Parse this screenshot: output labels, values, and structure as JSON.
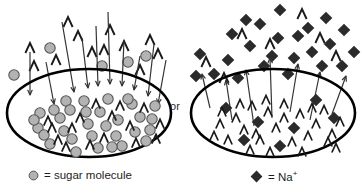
{
  "diagram": {
    "connector_label": "or",
    "colors": {
      "sugar_fill": "#b3b3b3",
      "sugar_stroke": "#555555",
      "sodium_fill": "#2b2b2b",
      "membrane_stroke": "#000000",
      "water_stroke": "#1a1a1a",
      "arrow_stroke": "#333333",
      "background": "#ffffff",
      "text": "#1d1d1d"
    }
  },
  "legend": {
    "sugar": {
      "symbol_name": "sugar-molecule-circle",
      "equals": "=",
      "label": "sugar molecule",
      "text": "= sugar molecule"
    },
    "sodium": {
      "symbol_name": "sodium-ion-diamond",
      "equals": "=",
      "label": "Na",
      "charge": "+",
      "text": "= Na+"
    }
  },
  "left_cell": {
    "name": "sugar-solution-cell",
    "membrane": {
      "cx": 89,
      "cy": 113,
      "rx": 82,
      "ry": 44
    },
    "solute_name": "sugar molecule",
    "water_flow_direction": "into cell",
    "solutes_inside": [
      [
        38,
        128
      ],
      [
        60,
        118
      ],
      [
        72,
        139
      ],
      [
        50,
        144
      ],
      [
        88,
        124
      ],
      [
        100,
        112
      ],
      [
        118,
        120
      ],
      [
        135,
        132
      ],
      [
        152,
        119
      ],
      [
        146,
        141
      ],
      [
        122,
        146
      ],
      [
        98,
        148
      ],
      [
        76,
        152
      ],
      [
        54,
        110
      ],
      [
        84,
        101
      ],
      [
        108,
        99
      ],
      [
        132,
        104
      ],
      [
        155,
        106
      ],
      [
        40,
        113
      ],
      [
        66,
        101
      ],
      [
        92,
        136
      ],
      [
        116,
        136
      ],
      [
        140,
        117
      ],
      [
        64,
        131
      ],
      [
        106,
        126
      ],
      [
        128,
        99
      ],
      [
        44,
        135
      ],
      [
        70,
        110
      ],
      [
        150,
        130
      ],
      [
        86,
        112
      ],
      [
        112,
        147
      ],
      [
        34,
        120
      ]
    ],
    "solutes_outside": [
      [
        14,
        75
      ],
      [
        50,
        48
      ],
      [
        102,
        66
      ],
      [
        128,
        62
      ],
      [
        146,
        56
      ]
    ],
    "waters_inside": [
      [
        48,
        121
      ],
      [
        80,
        118
      ],
      [
        96,
        104
      ],
      [
        112,
        116
      ],
      [
        130,
        126
      ],
      [
        58,
        140
      ],
      [
        144,
        108
      ],
      [
        160,
        124
      ],
      [
        72,
        128
      ],
      [
        104,
        138
      ],
      [
        136,
        143
      ],
      [
        90,
        145
      ],
      [
        52,
        128
      ],
      [
        120,
        106
      ],
      [
        156,
        139
      ],
      [
        66,
        147
      ]
    ],
    "waters_outside": [
      [
        30,
        48
      ],
      [
        56,
        60
      ],
      [
        78,
        36
      ],
      [
        92,
        52
      ],
      [
        110,
        30
      ],
      [
        124,
        46
      ],
      [
        140,
        70
      ],
      [
        158,
        54
      ],
      [
        34,
        66
      ],
      [
        104,
        50
      ],
      [
        68,
        22
      ],
      [
        150,
        40
      ]
    ],
    "arrows_inward": [
      [
        30,
        52,
        30,
        95
      ],
      [
        46,
        62,
        54,
        104
      ],
      [
        62,
        22,
        74,
        92
      ],
      [
        82,
        38,
        88,
        88
      ],
      [
        96,
        26,
        98,
        86
      ],
      [
        108,
        12,
        110,
        84
      ],
      [
        124,
        40,
        122,
        86
      ],
      [
        140,
        56,
        134,
        90
      ],
      [
        154,
        44,
        148,
        96
      ],
      [
        166,
        60,
        158,
        104
      ]
    ]
  },
  "right_cell": {
    "name": "sodium-solution-cell",
    "membrane": {
      "cx": 89,
      "cy": 113,
      "rx": 82,
      "ry": 44
    },
    "solute_name": "Na+",
    "water_flow_direction": "out of cell",
    "solutes_inside": [
      [
        42,
        108
      ],
      [
        74,
        122
      ],
      [
        110,
        128
      ],
      [
        132,
        100
      ],
      [
        60,
        140
      ],
      [
        150,
        118
      ],
      [
        96,
        146
      ]
    ],
    "solutes_outside": [
      [
        16,
        54
      ],
      [
        30,
        74
      ],
      [
        48,
        34
      ],
      [
        44,
        60
      ],
      [
        62,
        20
      ],
      [
        66,
        46
      ],
      [
        80,
        66
      ],
      [
        96,
        10
      ],
      [
        94,
        38
      ],
      [
        110,
        58
      ],
      [
        124,
        28
      ],
      [
        128,
        52
      ],
      [
        142,
        18
      ],
      [
        146,
        44
      ],
      [
        158,
        66
      ],
      [
        160,
        30
      ],
      [
        12,
        76
      ],
      [
        76,
        24
      ],
      [
        114,
        36
      ],
      [
        138,
        66
      ],
      [
        170,
        52
      ],
      [
        88,
        56
      ],
      [
        54,
        78
      ],
      [
        104,
        74
      ]
    ],
    "waters_inside": [
      [
        36,
        124
      ],
      [
        52,
        118
      ],
      [
        68,
        106
      ],
      [
        84,
        112
      ],
      [
        100,
        104
      ],
      [
        116,
        114
      ],
      [
        132,
        124
      ],
      [
        148,
        134
      ],
      [
        44,
        140
      ],
      [
        60,
        130
      ],
      [
        76,
        140
      ],
      [
        92,
        128
      ],
      [
        108,
        142
      ],
      [
        124,
        136
      ],
      [
        140,
        110
      ],
      [
        156,
        122
      ],
      [
        30,
        136
      ],
      [
        66,
        150
      ],
      [
        86,
        152
      ],
      [
        118,
        152
      ],
      [
        152,
        148
      ],
      [
        100,
        118
      ],
      [
        72,
        134
      ],
      [
        128,
        108
      ],
      [
        56,
        104
      ],
      [
        144,
        142
      ],
      [
        38,
        112
      ],
      [
        82,
        100
      ]
    ],
    "waters_outside": [
      [
        22,
        62
      ],
      [
        58,
        34
      ],
      [
        86,
        44
      ],
      [
        118,
        14
      ],
      [
        136,
        38
      ],
      [
        152,
        56
      ],
      [
        40,
        78
      ]
    ],
    "arrows_outward": [
      [
        26,
        108,
        18,
        74
      ],
      [
        48,
        120,
        42,
        80
      ],
      [
        70,
        126,
        62,
        70
      ],
      [
        88,
        118,
        86,
        58
      ],
      [
        106,
        112,
        114,
        64
      ],
      [
        126,
        120,
        136,
        72
      ],
      [
        148,
        114,
        162,
        76
      ]
    ]
  }
}
